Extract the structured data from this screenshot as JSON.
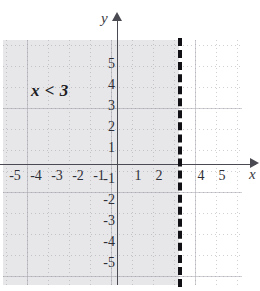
{
  "figure": {
    "annotation": "x < 3",
    "axis_labels": {
      "x": "x",
      "y": "y"
    },
    "colors": {
      "shading": "#e7e7e9",
      "axis": "#4a4a52",
      "boundary_line": "#111115",
      "grid": "#8c8c96",
      "background": "#ffffff",
      "text": "#2e2e36"
    }
  },
  "chart_data": {
    "type": "line",
    "title": "x < 3",
    "xlabel": "x",
    "ylabel": "y",
    "xlim": [
      -5.5,
      5.7
    ],
    "ylim": [
      -5.9,
      5.9
    ],
    "grid": true,
    "legend": null,
    "x_ticks": [
      -5,
      -4,
      -3,
      -2,
      -1,
      1,
      2,
      4,
      5
    ],
    "x_tick_labels": [
      "-5",
      "-4",
      "-3",
      "-2",
      "-1",
      "1",
      "2",
      "4",
      "5"
    ],
    "y_ticks": [
      5,
      4,
      3,
      2,
      1,
      -1,
      -2,
      -3,
      -4,
      -5
    ],
    "y_tick_labels": [
      "5",
      "4",
      "3",
      "2",
      "1",
      "-1",
      "-2",
      "-3",
      "-4",
      "-5"
    ],
    "series": [
      {
        "name": "boundary x = 3",
        "type": "vertical-line",
        "x": 3,
        "linestyle": "dashed",
        "included": false,
        "color": "#111115"
      },
      {
        "name": "solution region x < 3",
        "type": "shaded-halfplane",
        "inequality": "x < 3",
        "direction": "left",
        "color": "#e7e7e9"
      }
    ],
    "annotations": [
      {
        "text": "x < 3",
        "x": -3.9,
        "y": 3.8
      }
    ]
  },
  "ticks": {
    "x": [
      {
        "label": "-5",
        "left": 5,
        "top": 169
      },
      {
        "label": "-4",
        "left": 26,
        "top": 169
      },
      {
        "label": "-3",
        "left": 47,
        "top": 169
      },
      {
        "label": "-2",
        "left": 68,
        "top": 169
      },
      {
        "label": "-1",
        "left": 89,
        "top": 169
      },
      {
        "label": "1",
        "left": 128,
        "top": 169
      },
      {
        "label": "2",
        "left": 149,
        "top": 169
      },
      {
        "label": "4",
        "left": 191,
        "top": 169
      },
      {
        "label": "5",
        "left": 212,
        "top": 169
      }
    ],
    "y": [
      {
        "label": "5",
        "top": 57
      },
      {
        "label": "4",
        "top": 78
      },
      {
        "label": "3",
        "top": 99
      },
      {
        "label": "2",
        "top": 120
      },
      {
        "label": "1",
        "top": 141
      },
      {
        "label": "-1",
        "top": 172
      },
      {
        "label": "-2",
        "top": 193
      },
      {
        "label": "-3",
        "top": 214
      },
      {
        "label": "-4",
        "top": 235
      },
      {
        "label": "-5",
        "top": 256
      }
    ]
  }
}
